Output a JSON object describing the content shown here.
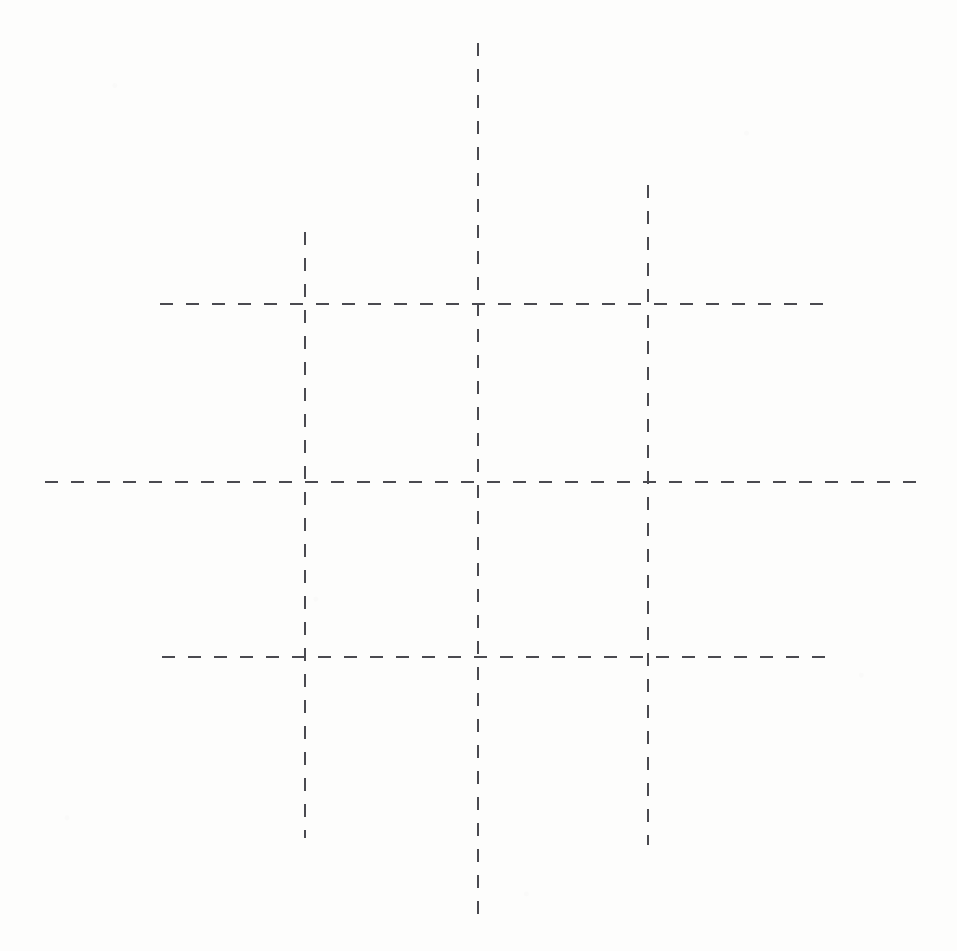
{
  "figure": {
    "title": "",
    "caption": "",
    "background_color": "#fdfdfc",
    "width": 957,
    "height": 951
  },
  "chart_data": {
    "type": "diagram",
    "subtype": "dashed-grid",
    "title": "",
    "xlabel": "",
    "ylabel": "",
    "grid": true,
    "legend": "none",
    "stroke_color": "#4a4a50",
    "stroke_width": 2,
    "dash_length": 13,
    "gap_length": 13,
    "xlim": [
      0,
      957
    ],
    "ylim": [
      0,
      951
    ],
    "vertical_lines": [
      {
        "name": "vertical-left",
        "x": 305,
        "y_start": 232,
        "y_end": 838
      },
      {
        "name": "vertical-center",
        "x": 478,
        "y_start": 43,
        "y_end": 915
      },
      {
        "name": "vertical-right",
        "x": 648,
        "y_start": 185,
        "y_end": 845
      }
    ],
    "horizontal_lines": [
      {
        "name": "horizontal-top",
        "y": 304,
        "x_start": 160,
        "x_end": 830
      },
      {
        "name": "horizontal-middle",
        "y": 482,
        "x_start": 45,
        "x_end": 917
      },
      {
        "name": "horizontal-bottom",
        "y": 657,
        "x_start": 162,
        "x_end": 830
      }
    ],
    "intersections": [
      {
        "x": 305,
        "y": 304
      },
      {
        "x": 478,
        "y": 304
      },
      {
        "x": 648,
        "y": 304
      },
      {
        "x": 305,
        "y": 482
      },
      {
        "x": 478,
        "y": 482
      },
      {
        "x": 648,
        "y": 482
      },
      {
        "x": 305,
        "y": 657
      },
      {
        "x": 478,
        "y": 657
      },
      {
        "x": 648,
        "y": 657
      }
    ],
    "cells": 9,
    "rows": 3,
    "columns": 3
  }
}
